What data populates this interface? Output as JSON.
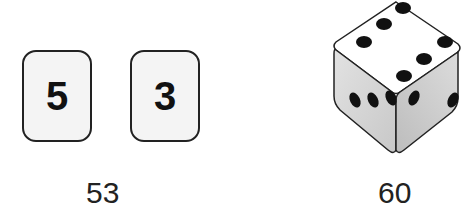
{
  "cards": [
    {
      "digit": "5"
    },
    {
      "digit": "3"
    }
  ],
  "cards_caption": "53",
  "dice": {
    "top_face_pips": 6,
    "left_face_pips": 3,
    "right_face_pips": 2
  },
  "dice_caption": "60"
}
